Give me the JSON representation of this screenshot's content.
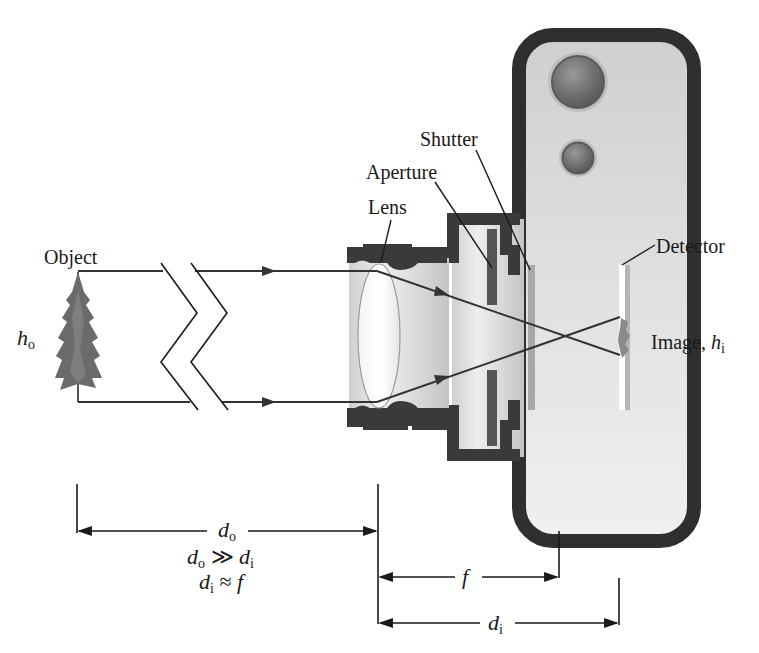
{
  "diagram": {
    "labels": {
      "object": "Object",
      "lens": "Lens",
      "aperture": "Aperture",
      "shutter": "Shutter",
      "detector": "Detector",
      "image": "Image, ",
      "image_h": "h",
      "image_h_sub": "i",
      "object_h": "h",
      "object_h_sub": "o"
    },
    "dimensions": {
      "do_label": "d",
      "do_sub": "o",
      "relation1_left": "d",
      "relation1_left_sub": "o",
      "relation1_op": " ≫ ",
      "relation1_right": "d",
      "relation1_right_sub": "i",
      "relation2_left": "d",
      "relation2_left_sub": "i",
      "relation2_op": " ≈ ",
      "relation2_right": "f",
      "f_label": "f",
      "di_label": "d",
      "di_sub": "i"
    },
    "colors": {
      "ink": "#1a1a1a",
      "body_border": "#2f2f2f",
      "body_fill": "#d9d9d9",
      "barrel": "#3a3a3a",
      "ray": "#333333",
      "tree": "#6b6b6b"
    }
  }
}
